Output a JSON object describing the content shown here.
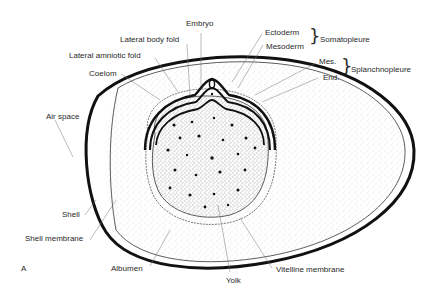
{
  "figure": {
    "panel_letter": "A",
    "labels": {
      "embryo": "Embryo",
      "lateral_body_fold": "Lateral body fold",
      "lateral_amniotic_fold": "Lateral amniotic fold",
      "coelom": "Coelom",
      "ectoderm": "Ectoderm",
      "mesoderm": "Mesoderm",
      "somatopleure": "Somatopleure",
      "mes": "Mes.",
      "end": "End.",
      "splanchnopleure": "Splanchnopleure",
      "air_space": "Air space",
      "shell": "Shell",
      "shell_membrane": "Shell membrane",
      "albumen": "Albumen",
      "yolk": "Yolk",
      "vitelline_membrane": "Vitelline membrane"
    },
    "colors": {
      "ink": "#1a1a1a",
      "background": "#ffffff",
      "stipple": "#555555"
    }
  }
}
